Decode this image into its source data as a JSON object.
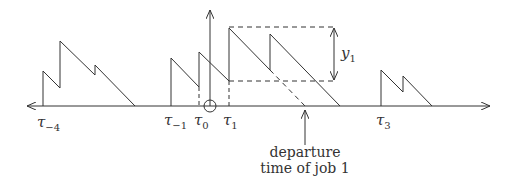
{
  "diagram": {
    "type": "workload sawtooth timeline",
    "colors": {
      "stroke": "#333333",
      "background": "#ffffff"
    },
    "axis": {
      "y": 106,
      "x_start": 27,
      "x_end": 490,
      "arrow_left": true,
      "arrow_right": true
    },
    "vertical_axis": {
      "x": 210,
      "y_top": 10,
      "origin_circle": true
    },
    "time_labels": [
      {
        "base": "τ",
        "sub": "−4",
        "x": 43
      },
      {
        "base": "τ",
        "sub": "−1",
        "x": 171
      },
      {
        "base": "τ",
        "sub": "0",
        "x": 199
      },
      {
        "base": "τ",
        "sub": "1",
        "x": 229
      },
      {
        "base": "τ",
        "sub": "3",
        "x": 381
      }
    ],
    "bracket_label": {
      "base": "y",
      "sub": "1"
    },
    "annotation": {
      "line1": "departure",
      "line2": "time of job 1"
    }
  }
}
